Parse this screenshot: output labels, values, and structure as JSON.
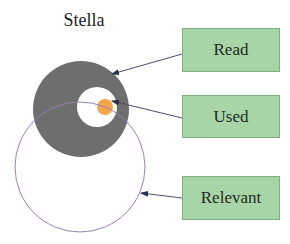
{
  "diagram": {
    "title": "Stella",
    "colors": {
      "read_fill": "#6e6e6e",
      "used_fill": "#f5a64a",
      "relevant_stroke": "#9a7fb3",
      "label_fill": "#a8d5a8",
      "label_border": "#7fae80",
      "arrow": "#4a4f6a"
    },
    "labels": [
      {
        "id": "read",
        "text": "Read"
      },
      {
        "id": "used",
        "text": "Used"
      },
      {
        "id": "relevant",
        "text": "Relevant"
      }
    ],
    "shapes": {
      "read_circle": {
        "cx": 81,
        "cy": 109,
        "r": 48
      },
      "read_hole": {
        "cx": 97,
        "cy": 107,
        "r": 20
      },
      "used_circle": {
        "cx": 105,
        "cy": 107,
        "r": 8
      },
      "relevant_circle": {
        "cx": 80,
        "cy": 167,
        "r": 65
      }
    }
  }
}
